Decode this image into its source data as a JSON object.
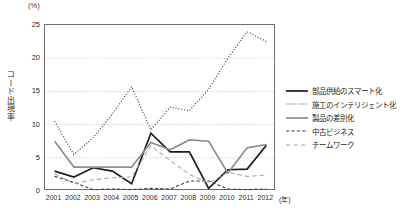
{
  "chart_data": {
    "type": "line",
    "title": "",
    "unit_label": "(%)",
    "ylabel": "コード出現率",
    "xlabel": "(年)",
    "categories": [
      "2001",
      "2002",
      "2003",
      "2004",
      "2005",
      "2006",
      "2007",
      "2008",
      "2009",
      "2010",
      "2011",
      "2012"
    ],
    "ylim": [
      0,
      25
    ],
    "yticks": [
      0,
      5,
      10,
      15,
      20,
      25
    ],
    "grid": true,
    "legend_position": "right",
    "series": [
      {
        "name": "部品供給のスマート化",
        "style": "solid",
        "color": "#1c1c1c",
        "width": 1.7,
        "values": [
          3.0,
          2.1,
          3.5,
          3.0,
          1.1,
          8.7,
          5.9,
          5.9,
          0.4,
          3.2,
          3.3,
          6.9
        ]
      },
      {
        "name": "施工のインテリジェント化",
        "style": "dotted",
        "color": "#4a4a4a",
        "width": 1.2,
        "values": [
          10.5,
          5.5,
          8.0,
          11.6,
          15.7,
          9.2,
          12.6,
          12.1,
          15.3,
          20.0,
          24.0,
          22.5
        ]
      },
      {
        "name": "製品の差別化",
        "style": "solid",
        "color": "#8e8e8e",
        "width": 1.7,
        "values": [
          7.5,
          3.6,
          3.6,
          3.6,
          3.6,
          7.3,
          6.2,
          7.7,
          7.5,
          2.7,
          6.5,
          7.0
        ]
      },
      {
        "name": "中古ビジネス",
        "style": "dashed",
        "color": "#3d3d3d",
        "width": 1.1,
        "values": [
          2.2,
          1.3,
          0.2,
          0.3,
          0.2,
          0.4,
          0.3,
          1.5,
          1.5,
          0.3,
          0.2,
          0.3
        ]
      },
      {
        "name": "チームワーク",
        "style": "dashdash",
        "color": "#a9a9a9",
        "width": 1.1,
        "values": [
          2.6,
          1.1,
          1.7,
          2.0,
          2.1,
          6.8,
          4.6,
          2.5,
          1.2,
          2.8,
          2.2,
          2.4
        ]
      }
    ]
  }
}
